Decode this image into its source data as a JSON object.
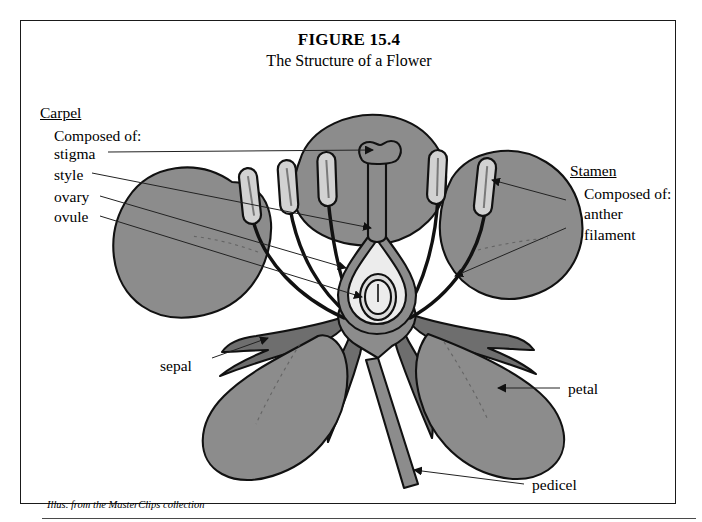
{
  "figure": {
    "number": "FIGURE 15.4",
    "subtitle": "The Structure of a Flower",
    "attribution": "Illus. from the MasterClips collection"
  },
  "labels": {
    "carpel_heading": "Carpel",
    "carpel_composed": "Composed of:",
    "stigma": "stigma",
    "style": "style",
    "ovary": "ovary",
    "ovule": "ovule",
    "stamen_heading": "Stamen",
    "stamen_composed": "Composed of:",
    "anther": "anther",
    "filament": "filament",
    "sepal": "sepal",
    "petal": "petal",
    "pedicel": "pedicel"
  },
  "colors": {
    "petal_gray": "#8c8c8c",
    "sepal_gray": "#6e6e6e",
    "outline_black": "#111111",
    "ovary_interior": "#ececec",
    "anther_light": "#d2d2d2",
    "background": "#ffffff",
    "frame_border": "#1a1a1a",
    "leader_line": "#222222"
  },
  "diagram": {
    "type": "botanical-cross-section",
    "subject": "flower",
    "parts": [
      {
        "name": "petal",
        "count": 5,
        "shading": "mid-gray"
      },
      {
        "name": "sepal",
        "count": 4,
        "shading": "dark-gray"
      },
      {
        "name": "anther",
        "count": 5,
        "shading": "light-gray-capsule"
      },
      {
        "name": "filament",
        "count": 5,
        "shading": "dark-thin-stalk"
      },
      {
        "name": "stigma",
        "count": 1,
        "shading": "mid-gray-lobed-head"
      },
      {
        "name": "style",
        "count": 1,
        "shading": "mid-gray-column"
      },
      {
        "name": "ovary",
        "count": 1,
        "shading": "cutaway-teardrop"
      },
      {
        "name": "ovule",
        "count": 1,
        "shading": "light-oval-inner"
      },
      {
        "name": "pedicel",
        "count": 1,
        "shading": "mid-gray-stem"
      }
    ]
  }
}
